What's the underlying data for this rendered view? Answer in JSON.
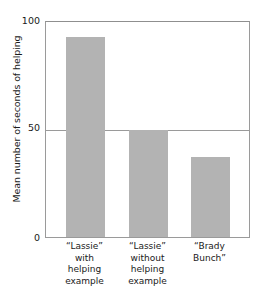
{
  "chart_data": {
    "type": "bar",
    "title": "",
    "xlabel": "",
    "ylabel": "Mean number of seconds of helping",
    "categories": [
      "“Lassie”\nwith\nhelping\nexample",
      "“Lassie”\nwithout\nhelping\nexample",
      "“Brady\nBunch”"
    ],
    "values": [
      93,
      50,
      37
    ],
    "ylim": [
      0,
      100
    ],
    "yticks": [
      "0",
      "50",
      "100"
    ],
    "ytick_values": [
      0,
      50,
      100
    ],
    "grid": "horizontal gridline at 50 only",
    "legend": "none",
    "bar_color": "#b3b3b3",
    "axis_color": "#9a9a9a",
    "series": [
      {
        "name": "Mean seconds of helping",
        "values": [
          93,
          50,
          37
        ]
      }
    ]
  },
  "axes": {
    "y_title": "Mean number of seconds of helping",
    "tick_top": "100",
    "tick_mid": "50",
    "tick_bottom": "0"
  },
  "x_axis": {
    "labels": [
      "“Lassie”\nwith\nhelping\nexample",
      "“Lassie”\nwithout\nhelping\nexample",
      "“Brady\nBunch”"
    ]
  }
}
